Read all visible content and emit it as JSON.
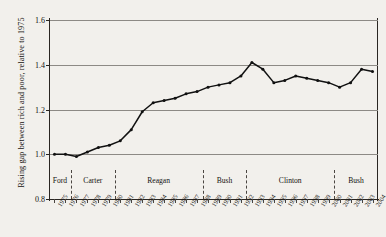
{
  "chart_data": {
    "type": "line",
    "title": "",
    "xlabel": "",
    "ylabel": "Rising gap between rich and poor, relative to 1975",
    "ylim": [
      0.8,
      1.6
    ],
    "yticks": [
      "0.8",
      "1.0",
      "1.2",
      "1.4",
      "1.6"
    ],
    "ytick_values": [
      0.8,
      1.0,
      1.2,
      1.4,
      1.6
    ],
    "grid": true,
    "legend": "none",
    "x": [
      1975,
      1976,
      1977,
      1978,
      1979,
      1980,
      1981,
      1982,
      1983,
      1984,
      1985,
      1986,
      1987,
      1988,
      1989,
      1990,
      1991,
      1992,
      1993,
      1994,
      1995,
      1996,
      1997,
      1998,
      1999,
      2000,
      2001,
      2002,
      2003,
      2004
    ],
    "categories": [
      "1975",
      "1976",
      "1977",
      "1978",
      "1979",
      "1980",
      "1981",
      "1982",
      "1983",
      "1984",
      "1985",
      "1986",
      "1987",
      "1988",
      "1989",
      "1990",
      "1991",
      "1992",
      "1993",
      "1994",
      "1995",
      "1996",
      "1997",
      "1998",
      "1999",
      "2000",
      "2001",
      "2002",
      "2003",
      "2004"
    ],
    "values": [
      1.0,
      1.0,
      0.99,
      1.01,
      1.03,
      1.04,
      1.06,
      1.11,
      1.19,
      1.23,
      1.24,
      1.25,
      1.27,
      1.28,
      1.3,
      1.31,
      1.32,
      1.35,
      1.41,
      1.38,
      1.32,
      1.33,
      1.35,
      1.34,
      1.33,
      1.32,
      1.3,
      1.32,
      1.38,
      1.37
    ],
    "series": [
      {
        "name": "Rising gap between rich and poor",
        "values": [
          1.0,
          1.0,
          0.99,
          1.01,
          1.03,
          1.04,
          1.06,
          1.11,
          1.19,
          1.23,
          1.24,
          1.25,
          1.27,
          1.28,
          1.3,
          1.31,
          1.32,
          1.35,
          1.41,
          1.38,
          1.32,
          1.33,
          1.35,
          1.34,
          1.33,
          1.32,
          1.3,
          1.32,
          1.38,
          1.37
        ],
        "color": "#111111",
        "marker": "dot"
      }
    ],
    "annotations": {
      "presidencies": [
        {
          "label": "Ford",
          "start": 1975,
          "end": 1977
        },
        {
          "label": "Carter",
          "start": 1977,
          "end": 1981
        },
        {
          "label": "Reagan",
          "start": 1981,
          "end": 1989
        },
        {
          "label": "Bush",
          "start": 1989,
          "end": 1993
        },
        {
          "label": "Clinton",
          "start": 1993,
          "end": 2001
        },
        {
          "label": "Bush",
          "start": 2001,
          "end": 2005
        }
      ]
    },
    "colors": {
      "background": "#f2f0ec",
      "line": "#111111",
      "grid": "#8d8a85",
      "axis": "#2a2622",
      "text": "#15120f"
    }
  }
}
